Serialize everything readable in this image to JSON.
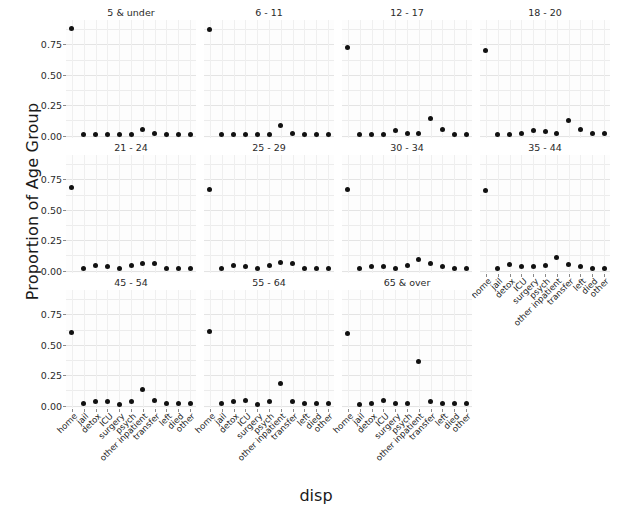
{
  "chart_data": {
    "type": "scatter",
    "title": "",
    "xlabel": "disp",
    "ylabel": "Proportion of Age Group",
    "facet_variable": "age group",
    "grid": true,
    "legend": "none",
    "ylim": [
      -0.02,
      0.95
    ],
    "yticks": [
      0.0,
      0.25,
      0.5,
      0.75
    ],
    "ytick_labels": [
      "0.00",
      "0.25",
      "0.50",
      "0.75"
    ],
    "categories": [
      "home",
      "jail",
      "detox",
      "ICU",
      "surgery",
      "psych",
      "other inpatient",
      "transfer",
      "left",
      "died",
      "other"
    ],
    "facets": [
      {
        "label": "5 & under",
        "row": 0,
        "col": 0,
        "values": [
          0.88,
          0.01,
          0.01,
          0.01,
          0.01,
          0.01,
          0.05,
          0.02,
          0.01,
          0.01,
          0.01
        ]
      },
      {
        "label": "6 - 11",
        "row": 0,
        "col": 1,
        "values": [
          0.87,
          0.01,
          0.01,
          0.01,
          0.01,
          0.01,
          0.08,
          0.02,
          0.01,
          0.01,
          0.01
        ]
      },
      {
        "label": "12 - 17",
        "row": 0,
        "col": 2,
        "values": [
          0.72,
          0.01,
          0.01,
          0.01,
          0.04,
          0.02,
          0.02,
          0.14,
          0.05,
          0.01,
          0.01
        ]
      },
      {
        "label": "18 - 20",
        "row": 0,
        "col": 3,
        "values": [
          0.7,
          0.01,
          0.01,
          0.02,
          0.04,
          0.03,
          0.02,
          0.12,
          0.05,
          0.02,
          0.02
        ]
      },
      {
        "label": "21 - 24",
        "row": 1,
        "col": 0,
        "values": [
          0.68,
          0.02,
          0.04,
          0.03,
          0.02,
          0.04,
          0.06,
          0.06,
          0.02,
          0.02,
          0.02
        ]
      },
      {
        "label": "25 - 29",
        "row": 1,
        "col": 1,
        "values": [
          0.67,
          0.02,
          0.04,
          0.03,
          0.02,
          0.04,
          0.07,
          0.06,
          0.02,
          0.02,
          0.02
        ]
      },
      {
        "label": "30 - 34",
        "row": 1,
        "col": 2,
        "values": [
          0.67,
          0.02,
          0.03,
          0.03,
          0.02,
          0.04,
          0.09,
          0.06,
          0.03,
          0.02,
          0.02
        ]
      },
      {
        "label": "35 - 44",
        "row": 1,
        "col": 3,
        "values": [
          0.66,
          0.02,
          0.05,
          0.03,
          0.03,
          0.04,
          0.11,
          0.05,
          0.03,
          0.02,
          0.02
        ]
      },
      {
        "label": "45 - 54",
        "row": 2,
        "col": 0,
        "values": [
          0.6,
          0.02,
          0.03,
          0.03,
          0.01,
          0.03,
          0.13,
          0.04,
          0.02,
          0.02,
          0.02
        ]
      },
      {
        "label": "55 - 64",
        "row": 2,
        "col": 1,
        "values": [
          0.61,
          0.02,
          0.03,
          0.04,
          0.01,
          0.03,
          0.18,
          0.03,
          0.02,
          0.02,
          0.02
        ]
      },
      {
        "label": "65 & over",
        "row": 2,
        "col": 2,
        "values": [
          0.59,
          0.01,
          0.02,
          0.04,
          0.02,
          0.02,
          0.36,
          0.03,
          0.02,
          0.02,
          0.02
        ]
      }
    ]
  },
  "axis": {
    "x_title": "disp",
    "y_title": "Proportion of Age Group"
  },
  "style": {
    "point_color": "#111111",
    "grid_color": "#ececec",
    "panel_bg": "#fdfdfd"
  }
}
